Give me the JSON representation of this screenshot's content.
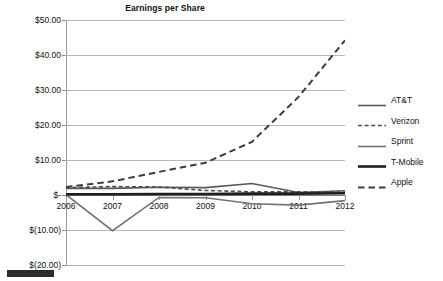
{
  "chart": {
    "title": "Earnings per Share"
  },
  "axes": {
    "y_ticks": [
      {
        "label": "$50.00",
        "value": 50
      },
      {
        "label": "$40.00",
        "value": 40
      },
      {
        "label": "$30.00",
        "value": 30
      },
      {
        "label": "$20.00",
        "value": 20
      },
      {
        "label": "$10.00",
        "value": 10
      },
      {
        "label": "$-",
        "value": 0
      },
      {
        "label": "$(10.00)",
        "value": -10
      },
      {
        "label": "$(20.00)",
        "value": -20
      }
    ],
    "x_ticks": [
      "2006",
      "2007",
      "2008",
      "2009",
      "2010",
      "2011",
      "2012"
    ]
  },
  "legend": {
    "items": [
      {
        "label": "AT&T",
        "style": "solid",
        "color": "#595959",
        "width": 1.6
      },
      {
        "label": "Verizon",
        "style": "dashed-fine",
        "color": "#4d4d4d",
        "width": 1.6
      },
      {
        "label": "Sprint",
        "style": "solid",
        "color": "#737373",
        "width": 1.6
      },
      {
        "label": "T-Mobile",
        "style": "solid",
        "color": "#1f1f1f",
        "width": 2.6
      },
      {
        "label": "Apple",
        "style": "dashed-long",
        "color": "#3d3d3d",
        "width": 2.0
      }
    ]
  },
  "chart_data": {
    "type": "line",
    "title": "Earnings per Share",
    "xlabel": "",
    "ylabel": "",
    "x": [
      2006,
      2007,
      2008,
      2009,
      2010,
      2011,
      2012
    ],
    "ylim": [
      -20,
      50
    ],
    "xlim": [
      2006,
      2012
    ],
    "grid": true,
    "legend_position": "right",
    "y_tick_values": [
      50,
      40,
      30,
      20,
      10,
      0,
      -10,
      -20
    ],
    "y_tick_labels": [
      "$50.00",
      "$40.00",
      "$30.00",
      "$20.00",
      "$10.00",
      "$-",
      "$(10.00)",
      "$(20.00)"
    ],
    "series": [
      {
        "name": "AT&T",
        "values": [
          1.9,
          1.9,
          2.2,
          2.1,
          3.3,
          0.7,
          1.2
        ],
        "style": "solid",
        "color": "#595959",
        "width": 1.6
      },
      {
        "name": "Verizon",
        "values": [
          2.1,
          2.4,
          2.3,
          1.3,
          0.9,
          0.9,
          0.8
        ],
        "style": "dashed-fine",
        "color": "#4d4d4d",
        "width": 1.6
      },
      {
        "name": "Sprint",
        "values": [
          0.1,
          -10.2,
          -0.7,
          -0.8,
          -2.5,
          -2.9,
          -1.6
        ],
        "style": "solid",
        "color": "#737373",
        "width": 1.6
      },
      {
        "name": "T-Mobile",
        "values": [
          0.2,
          0.2,
          0.3,
          0.3,
          0.4,
          0.4,
          0.5
        ],
        "style": "solid",
        "color": "#1f1f1f",
        "width": 2.6
      },
      {
        "name": "Apple",
        "values": [
          2.3,
          3.9,
          6.6,
          9.2,
          15.2,
          28.0,
          44.2
        ],
        "style": "dashed-long",
        "color": "#3d3d3d",
        "width": 2.0
      }
    ]
  }
}
